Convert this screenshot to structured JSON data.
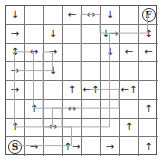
{
  "puzzle": {
    "rows": 8,
    "cols": 8,
    "start_label": "S",
    "finish_label": "F",
    "colors": {
      "grid": "#777777",
      "arrow": "#222222",
      "path": "#aaaaaa"
    },
    "cells": [
      [
        "↓",
        "",
        "",
        "←",
        "↔",
        "↓",
        "",
        "F"
      ],
      [
        "→",
        "",
        "↓",
        "",
        "",
        "↓→",
        "",
        "↕"
      ],
      [
        "↕",
        "↔",
        "→",
        "",
        "",
        "↓",
        "←",
        "←"
      ],
      [
        "→",
        "",
        "↓",
        "",
        "",
        "",
        "",
        ""
      ],
      [
        "→",
        "",
        "",
        "↑",
        "←↑",
        "",
        "←↑",
        ""
      ],
      [
        "",
        "↑",
        "",
        "↔",
        "",
        "",
        "",
        "↑"
      ],
      [
        "↑",
        "",
        "↔",
        "",
        "",
        "",
        "↑",
        ""
      ],
      [
        "S",
        "→",
        "",
        "↑→",
        "",
        "→",
        "",
        "↑"
      ]
    ]
  }
}
